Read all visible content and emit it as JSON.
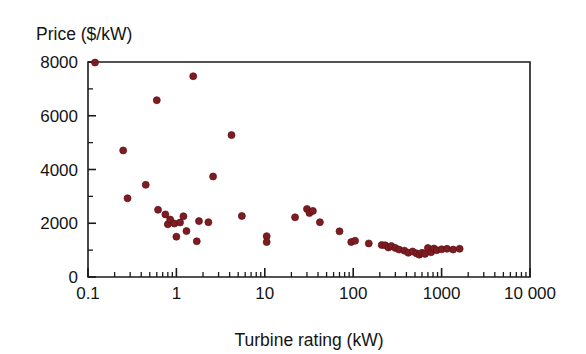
{
  "chart": {
    "y_axis_title": "Price ($/kW)",
    "x_axis_title": "Turbine rating (kW)"
  },
  "chart_data": {
    "type": "scatter",
    "title": "",
    "subtitle": "",
    "xlabel": "Turbine rating (kW)",
    "ylabel": "Price ($/kW)",
    "xscale": "log",
    "yscale": "linear",
    "xlim": [
      0.1,
      10000
    ],
    "ylim": [
      0,
      8000
    ],
    "grid": false,
    "legend": null,
    "x_tick_labels": [
      "0.1",
      "1",
      "10",
      "100",
      "1000",
      "10 000"
    ],
    "x_tick_values": [
      0.1,
      1,
      10,
      100,
      1000,
      10000
    ],
    "x_minor_ticks": "decade subdivisions 2-9",
    "y_tick_labels": [
      "0",
      "2000",
      "4000",
      "6000",
      "8000"
    ],
    "y_tick_values": [
      0,
      2000,
      4000,
      6000,
      8000
    ],
    "y_minor_tick_values": [
      1000,
      3000,
      5000,
      7000
    ],
    "marker_color": "#7d1d22",
    "marker_shape": "circle",
    "series": [
      {
        "name": "Turbine price vs rating",
        "points": [
          [
            0.12,
            7980
          ],
          [
            0.25,
            4710
          ],
          [
            0.28,
            2930
          ],
          [
            0.45,
            3430
          ],
          [
            0.6,
            6580
          ],
          [
            0.62,
            2500
          ],
          [
            0.75,
            2330
          ],
          [
            0.8,
            1960
          ],
          [
            0.85,
            2140
          ],
          [
            0.95,
            1990
          ],
          [
            1.0,
            1500
          ],
          [
            1.1,
            2030
          ],
          [
            1.2,
            2260
          ],
          [
            1.3,
            1710
          ],
          [
            1.55,
            7470
          ],
          [
            1.7,
            1330
          ],
          [
            1.8,
            2080
          ],
          [
            2.3,
            2040
          ],
          [
            2.6,
            3740
          ],
          [
            4.2,
            5280
          ],
          [
            5.5,
            2270
          ],
          [
            10.5,
            1520
          ],
          [
            10.5,
            1300
          ],
          [
            22,
            2220
          ],
          [
            30,
            2530
          ],
          [
            32,
            2380
          ],
          [
            35,
            2460
          ],
          [
            42,
            2040
          ],
          [
            70,
            1700
          ],
          [
            95,
            1300
          ],
          [
            105,
            1350
          ],
          [
            150,
            1250
          ],
          [
            210,
            1190
          ],
          [
            230,
            1180
          ],
          [
            250,
            1100
          ],
          [
            270,
            1150
          ],
          [
            300,
            1080
          ],
          [
            330,
            1020
          ],
          [
            380,
            980
          ],
          [
            420,
            900
          ],
          [
            470,
            950
          ],
          [
            520,
            880
          ],
          [
            560,
            830
          ],
          [
            600,
            900
          ],
          [
            650,
            860
          ],
          [
            700,
            1080
          ],
          [
            760,
            920
          ],
          [
            820,
            1060
          ],
          [
            880,
            1000
          ],
          [
            1000,
            1030
          ],
          [
            1150,
            1050
          ],
          [
            1350,
            1020
          ],
          [
            1600,
            1050
          ]
        ]
      }
    ]
  }
}
